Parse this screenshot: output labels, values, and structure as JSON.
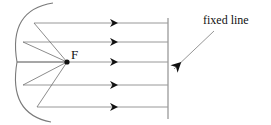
{
  "figure": {
    "kind": "geometry-diagram",
    "background_color": "#ffffff",
    "stroke_color": "#6b6b6b",
    "ray_color": "#8a8a8a",
    "ink_color": "#111111",
    "labels": {
      "focus": "F",
      "fixed_line": "fixed line"
    },
    "focus_point": {
      "x": 67,
      "y": 62
    },
    "directrix": {
      "name": "fixed line",
      "x": 168,
      "y_top": 18,
      "y_bottom": 119
    },
    "parabola": {
      "vertex": {
        "x": 17,
        "y": 62
      },
      "opens": "left",
      "top_end": {
        "x": 53,
        "y": 3
      },
      "bottom_end": {
        "x": 51,
        "y": 122
      }
    },
    "incoming_rays": [
      {
        "y": 23,
        "x_start": 168,
        "x_end": 34,
        "arrow_x": 118
      },
      {
        "y": 42,
        "x_start": 168,
        "x_end": 23,
        "arrow_x": 118
      },
      {
        "y": 62,
        "x_start": 168,
        "x_end": 17,
        "arrow_x": 118
      },
      {
        "y": 85,
        "x_start": 168,
        "x_end": 23,
        "arrow_x": 118
      },
      {
        "y": 107,
        "x_start": 168,
        "x_end": 37,
        "arrow_x": 118
      }
    ],
    "reflected_rays": [
      {
        "from_x": 34,
        "from_y": 23,
        "to_x": 67,
        "to_y": 62
      },
      {
        "from_x": 23,
        "from_y": 42,
        "to_x": 67,
        "to_y": 62
      },
      {
        "from_x": 17,
        "from_y": 62,
        "to_x": 67,
        "to_y": 62
      },
      {
        "from_x": 23,
        "from_y": 85,
        "to_x": 67,
        "to_y": 62
      },
      {
        "from_x": 37,
        "from_y": 107,
        "to_x": 67,
        "to_y": 62
      }
    ],
    "annotation_arrow": {
      "from_x": 214,
      "from_y": 31,
      "to_x": 170,
      "to_y": 73
    }
  }
}
